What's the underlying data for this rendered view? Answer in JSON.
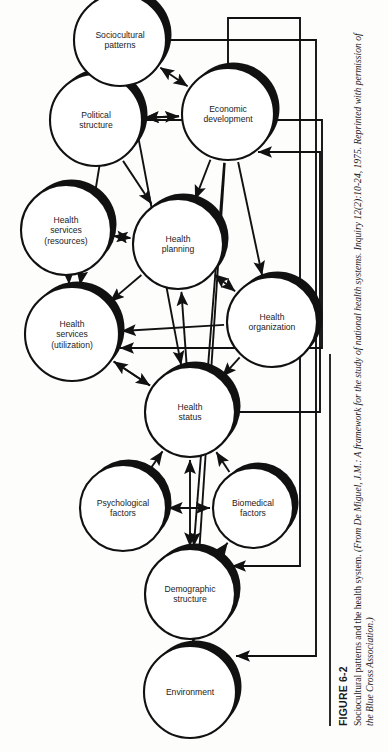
{
  "figure": {
    "number_label": "FIGURE 6-2",
    "caption_main": "Sociocultural patterns and the health system.",
    "caption_source": "(From De Miguel, J.M.: A framework for the study of national health systems. Inquiry 12(2):10-24, 1975. Reprinted with permission of the Blue Cross Association.)"
  },
  "diagram": {
    "type": "node-link-diagram",
    "orientation_degrees": -90,
    "node_style": {
      "fill": "#ffffff",
      "stroke": "#111111",
      "shadow": "#111111"
    },
    "nodes": [
      {
        "id": "environment",
        "label": "Environment",
        "cx": 60,
        "cy": 190,
        "r": 46
      },
      {
        "id": "demographic",
        "label": "Demographic\nstructure",
        "cx": 158,
        "cy": 190,
        "r": 45
      },
      {
        "id": "psychological",
        "label": "Psychological\nfactors",
        "cx": 244,
        "cy": 123,
        "r": 43
      },
      {
        "id": "biomedical",
        "label": "Biomedical\nfactors",
        "cx": 244,
        "cy": 253,
        "r": 40
      },
      {
        "id": "health-status",
        "label": "Health\nstatus",
        "cx": 340,
        "cy": 190,
        "r": 45
      },
      {
        "id": "hs-utilization",
        "label": "Health\nservices\n(utilization)",
        "cx": 418,
        "cy": 72,
        "r": 47
      },
      {
        "id": "hs-resources",
        "label": "Health\nservices\n(resources)",
        "cx": 522,
        "cy": 66,
        "r": 45
      },
      {
        "id": "health-planning",
        "label": "Health\nplanning",
        "cx": 508,
        "cy": 178,
        "r": 45
      },
      {
        "id": "health-org",
        "label": "Health\norganization",
        "cx": 430,
        "cy": 272,
        "r": 45
      },
      {
        "id": "political",
        "label": "Political\nstructure",
        "cx": 632,
        "cy": 96,
        "r": 46
      },
      {
        "id": "economic",
        "label": "Economic\ndevelopment",
        "cx": 638,
        "cy": 228,
        "r": 46
      },
      {
        "id": "sociocultural",
        "label": "Sociocultural\npatterns",
        "cx": 712,
        "cy": 120,
        "r": 46
      }
    ],
    "edges": [
      {
        "from": "environment",
        "to": "demographic",
        "kind": "arrow"
      },
      {
        "from": "demographic",
        "to": "biomedical",
        "kind": "arrow"
      },
      {
        "from": "demographic",
        "to": "health-status",
        "kind": "double"
      },
      {
        "from": "psychological",
        "to": "biomedical",
        "kind": "double"
      },
      {
        "from": "psychological",
        "to": "health-status",
        "kind": "arrow"
      },
      {
        "from": "biomedical",
        "to": "health-status",
        "kind": "arrow"
      },
      {
        "from": "health-status",
        "to": "hs-utilization",
        "kind": "arrow"
      },
      {
        "from": "hs-utilization",
        "to": "health-status",
        "kind": "arrow"
      },
      {
        "from": "hs-resources",
        "to": "hs-utilization",
        "kind": "arrow"
      },
      {
        "from": "health-planning",
        "to": "hs-utilization",
        "kind": "arrow"
      },
      {
        "from": "health-planning",
        "to": "hs-resources",
        "kind": "double"
      },
      {
        "from": "health-status",
        "to": "health-planning",
        "kind": "arrow"
      },
      {
        "from": "health-planning",
        "to": "health-org",
        "kind": "double"
      },
      {
        "from": "health-org",
        "to": "health-status",
        "kind": "arrow"
      },
      {
        "from": "health-org",
        "to": "hs-utilization",
        "kind": "arrow"
      },
      {
        "from": "political",
        "to": "economic",
        "kind": "double"
      },
      {
        "from": "political",
        "to": "health-planning",
        "kind": "arrow"
      },
      {
        "from": "economic",
        "to": "health-planning",
        "kind": "arrow"
      },
      {
        "from": "economic",
        "to": "health-org",
        "kind": "arrow"
      },
      {
        "from": "economic",
        "to": "political",
        "kind": "arrow"
      },
      {
        "from": "sociocultural",
        "to": "political",
        "kind": "arrow"
      },
      {
        "from": "sociocultural",
        "to": "economic",
        "kind": "double"
      },
      {
        "from": "economic",
        "to": "environment",
        "kind": "arrow"
      },
      {
        "from": "economic",
        "to": "demographic",
        "kind": "arrow"
      },
      {
        "from": "sociocultural",
        "to": "hs-utilization",
        "kind": "arrow"
      },
      {
        "from": "sociocultural",
        "to": "health-status",
        "kind": "arrow"
      }
    ]
  }
}
